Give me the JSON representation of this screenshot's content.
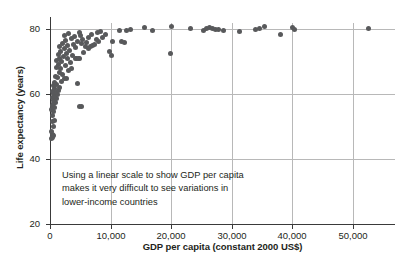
{
  "chart_data": {
    "type": "scatter",
    "title": "",
    "xlabel": "GDP per capita (constant 2000 US$)",
    "ylabel": "Life expectancy (years)",
    "xlim": [
      0,
      57000
    ],
    "ylim": [
      20,
      82
    ],
    "xticks": [
      0,
      10000,
      20000,
      30000,
      40000,
      50000
    ],
    "xticklabels": [
      "0",
      "10,000",
      "20,000",
      "30,000",
      "40,000",
      "50,000"
    ],
    "yticks": [
      20,
      40,
      60,
      80
    ],
    "yticklabels": [
      "20",
      "40",
      "60",
      "80"
    ],
    "grid": "both",
    "legend": "none",
    "marker_color": "#58595b",
    "grid_color": "#b8b8b8",
    "axis_color": "#3a3a3a",
    "annotation": {
      "line1": "Using a linear scale to show GDP per capita",
      "line2": "makes it very difficult to see variations in",
      "line3": "lower-income countries"
    },
    "points": [
      [
        300,
        46.5
      ],
      [
        380,
        46.8
      ],
      [
        420,
        47.6
      ],
      [
        330,
        48.4
      ],
      [
        500,
        47.2
      ],
      [
        620,
        50.1
      ],
      [
        350,
        51.5
      ],
      [
        700,
        52.0
      ],
      [
        450,
        53.4
      ],
      [
        560,
        54.6
      ],
      [
        300,
        55.3
      ],
      [
        820,
        55.8
      ],
      [
        400,
        56.4
      ],
      [
        640,
        57.1
      ],
      [
        900,
        57.6
      ],
      [
        520,
        58.2
      ],
      [
        1100,
        58.6
      ],
      [
        350,
        59.0
      ],
      [
        760,
        59.4
      ],
      [
        1250,
        59.8
      ],
      [
        600,
        60.2
      ],
      [
        980,
        60.6
      ],
      [
        430,
        61.0
      ],
      [
        1400,
        61.3
      ],
      [
        820,
        61.8
      ],
      [
        1600,
        62.2
      ],
      [
        540,
        62.6
      ],
      [
        1150,
        63.0
      ],
      [
        700,
        63.5
      ],
      [
        1850,
        63.9
      ],
      [
        2400,
        64.8
      ],
      [
        1300,
        65.2
      ],
      [
        900,
        65.6
      ],
      [
        2100,
        66.2
      ],
      [
        1500,
        66.8
      ],
      [
        3000,
        67.4
      ],
      [
        1750,
        68.0
      ],
      [
        1050,
        68.4
      ],
      [
        2600,
        68.9
      ],
      [
        1350,
        69.3
      ],
      [
        3400,
        69.7
      ],
      [
        1900,
        70.1
      ],
      [
        1150,
        70.5
      ],
      [
        2900,
        70.9
      ],
      [
        1600,
        71.2
      ],
      [
        4400,
        71.0
      ],
      [
        4900,
        71.1
      ],
      [
        2200,
        71.6
      ],
      [
        3700,
        72.0
      ],
      [
        1400,
        72.3
      ],
      [
        2700,
        72.7
      ],
      [
        5600,
        73.0
      ],
      [
        1800,
        73.2
      ],
      [
        3300,
        73.6
      ],
      [
        2400,
        74.0
      ],
      [
        4200,
        74.3
      ],
      [
        1550,
        74.6
      ],
      [
        6400,
        74.2
      ],
      [
        5900,
        74.6
      ],
      [
        6700,
        74.9
      ],
      [
        2950,
        75.1
      ],
      [
        7000,
        75.2
      ],
      [
        3900,
        75.4
      ],
      [
        7300,
        75.5
      ],
      [
        2100,
        75.7
      ],
      [
        5200,
        75.8
      ],
      [
        6100,
        76.0
      ],
      [
        8000,
        76.2
      ],
      [
        4600,
        76.4
      ],
      [
        2550,
        76.6
      ],
      [
        5400,
        76.8
      ],
      [
        7600,
        77.0
      ],
      [
        3500,
        77.2
      ],
      [
        6300,
        77.4
      ],
      [
        8600,
        77.6
      ],
      [
        4100,
        77.8
      ],
      [
        2350,
        78.0
      ],
      [
        5000,
        78.2
      ],
      [
        9200,
        78.4
      ],
      [
        6900,
        78.6
      ],
      [
        3100,
        78.8
      ],
      [
        7800,
        79.0
      ],
      [
        4800,
        79.2
      ],
      [
        8300,
        79.4
      ],
      [
        10400,
        76.2
      ],
      [
        9900,
        73.2
      ],
      [
        10100,
        72.0
      ],
      [
        11800,
        76.3
      ],
      [
        12300,
        75.9
      ],
      [
        12600,
        79.8
      ],
      [
        11500,
        79.6
      ],
      [
        13300,
        79.9
      ],
      [
        15600,
        80.6
      ],
      [
        17000,
        79.8
      ],
      [
        19900,
        72.5
      ],
      [
        20100,
        80.8
      ],
      [
        23200,
        80.3
      ],
      [
        25300,
        79.6
      ],
      [
        25900,
        80.2
      ],
      [
        26300,
        80.5
      ],
      [
        26900,
        80.3
      ],
      [
        27400,
        80.0
      ],
      [
        27900,
        79.9
      ],
      [
        28600,
        79.8
      ],
      [
        31300,
        79.4
      ],
      [
        33900,
        79.9
      ],
      [
        34600,
        80.4
      ],
      [
        35400,
        81.0
      ],
      [
        38000,
        78.6
      ],
      [
        40000,
        80.7
      ],
      [
        40400,
        79.9
      ],
      [
        52600,
        80.2
      ],
      [
        4600,
        63.2
      ],
      [
        4900,
        56.3
      ],
      [
        5200,
        56.3
      ],
      [
        4200,
        70.9
      ],
      [
        4700,
        70.9
      ],
      [
        2700,
        64.9
      ],
      [
        3600,
        67.9
      ]
    ]
  }
}
